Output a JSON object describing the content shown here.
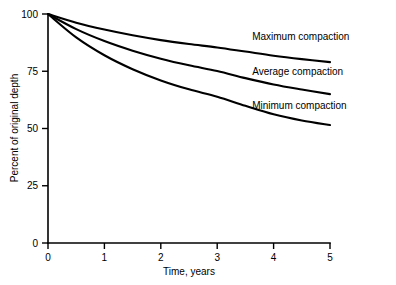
{
  "chart_data": {
    "type": "line",
    "title": "",
    "xlabel": "Time, years",
    "ylabel": "Percent of original depth",
    "xlim": [
      0,
      5
    ],
    "ylim": [
      0,
      100
    ],
    "xticks": [
      0,
      1,
      2,
      3,
      4,
      5
    ],
    "yticks": [
      0,
      25,
      50,
      75,
      100
    ],
    "xtick_labels": [
      "0",
      "1",
      "2",
      "3",
      "4",
      "5"
    ],
    "ytick_labels": [
      "0",
      "25",
      "50",
      "75",
      "100"
    ],
    "grid": false,
    "legend_position": "inline-right-of-curves",
    "x": [
      0,
      0.5,
      1,
      1.5,
      2,
      2.5,
      3,
      3.5,
      4,
      4.5,
      5
    ],
    "series": [
      {
        "name": "Maximum compaction",
        "label": "Maximum compaction",
        "values": [
          100,
          96.2,
          93.2,
          90.7,
          88.6,
          86.9,
          85.4,
          83.6,
          81.8,
          80.3,
          79.0
        ]
      },
      {
        "name": "Average compaction",
        "label": "Average compaction",
        "values": [
          100,
          93.4,
          88.2,
          84.0,
          80.5,
          77.6,
          75.1,
          72.0,
          69.2,
          67.0,
          65.0
        ]
      },
      {
        "name": "Minimum compaction",
        "label": "Minimum compaction",
        "values": [
          100,
          89.8,
          82.0,
          75.9,
          71.0,
          67.1,
          63.9,
          59.9,
          56.2,
          53.5,
          51.5
        ]
      }
    ],
    "series_label_anchors": [
      {
        "x": 3.62,
        "y": 88.5
      },
      {
        "x": 3.62,
        "y": 73.5
      },
      {
        "x": 3.62,
        "y": 58.5
      }
    ],
    "colors": {
      "curve": "#000000",
      "axis": "#000000",
      "background": "#ffffff",
      "text": "#000000"
    }
  }
}
